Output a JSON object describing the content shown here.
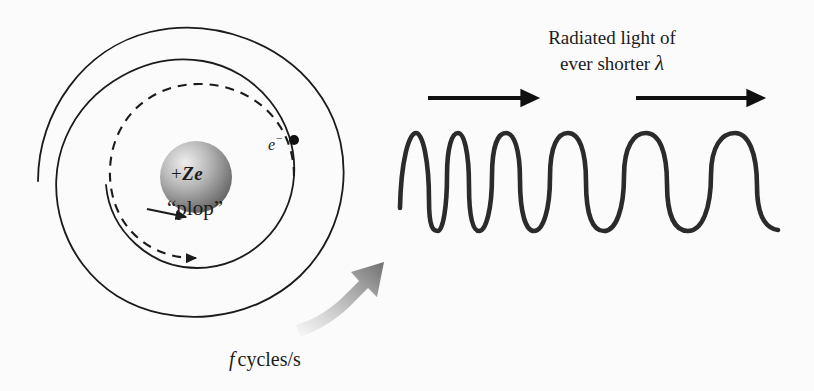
{
  "figure": {
    "background_color": "#fbfbfb",
    "ink_color": "#1b1b1b"
  },
  "atom": {
    "nucleus": {
      "charge_sign": "+",
      "charge_symbol": "Ze",
      "label": "+ Ze",
      "center_x": 196,
      "center_y": 177,
      "radius": 36,
      "fill_light": "#e8e8e8",
      "fill_dark": "#5d5d5d"
    },
    "electron": {
      "label": "e",
      "charge_superscript": "−",
      "dot_x": 294,
      "dot_y": 140,
      "dot_radius": 5
    },
    "impact_label": "“plop”",
    "spiral": {
      "turns_solid": 2.5,
      "turns_dashed": 1.0,
      "outer_radius": 148,
      "inner_radius": 40,
      "center_x": 196,
      "center_y": 177,
      "dash_pattern": "9 7",
      "stroke_width": 1.8
    },
    "rotation_arrow": {
      "label": "f cycles/s",
      "frequency_symbol": "f",
      "unit_text": "cycles/s",
      "gradient_from": "#f2f2f2",
      "gradient_to": "#7a7a7a"
    }
  },
  "radiation": {
    "caption_line1": "Radiated light of",
    "caption_line2_prefix": "ever shorter ",
    "caption_line2_symbol": "λ",
    "arrows": [
      {
        "x1": 428,
        "x2": 540,
        "y": 98
      },
      {
        "x1": 636,
        "x2": 766,
        "y": 98
      }
    ],
    "wave": {
      "baseline_top": 133,
      "baseline_bottom": 230,
      "start_x": 400,
      "end_x": 778,
      "stroke_width": 4.6,
      "peaks_x": [
        415,
        443,
        478,
        545,
        635,
        735
      ],
      "wavelength_trend": "increasing left to right",
      "peak_count": 6
    }
  }
}
